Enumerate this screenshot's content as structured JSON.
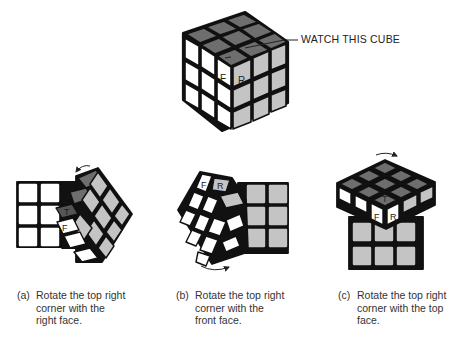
{
  "main_cube": {
    "callout": "WATCH THIS CUBE",
    "sticker_labels": {
      "top": "T",
      "front": "F",
      "right": "R"
    }
  },
  "panels": [
    {
      "id": "a",
      "label": "(a)",
      "caption": "Rotate the top right corner with the right face.",
      "rotation": "right-face",
      "arrow": "counterclockwise-top"
    },
    {
      "id": "b",
      "label": "(b)",
      "caption": "Rotate the top right corner with the front face.",
      "rotation": "front-face",
      "arrow": "bottom"
    },
    {
      "id": "c",
      "label": "(c)",
      "caption": "Rotate the top right corner with the top face.",
      "rotation": "top-face",
      "arrow": "top"
    }
  ],
  "colors": {
    "top": "#6e6e6e",
    "front": "#ffffff",
    "right": "#c4c4c4",
    "outline": "#111111"
  }
}
